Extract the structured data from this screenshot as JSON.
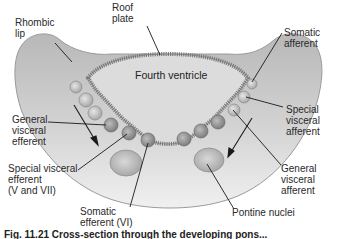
{
  "diagram": {
    "labels": {
      "roof_plate": "Roof\nplate",
      "rhombic_lip": "Rhombic\nlip",
      "fourth_ventricle": "Fourth ventricle",
      "somatic_afferent": "Somatic\nafferent",
      "special_visceral_afferent": "Special\nvisceral\nafferent",
      "general_visceral_efferent": "General\nvisceral\nefferent",
      "special_visceral_efferent": "Special visceral\nefferent\n(V and VII)",
      "general_visceral_afferent": "General\nvisceral\nafferent",
      "somatic_efferent": "Somatic\nefferent (VI)",
      "pontine_nuclei": "Pontine nuclei"
    },
    "caption": "Fig. 11.21  Cross-section through the developing pons...",
    "colors": {
      "tissue_light": "#e8e8e8",
      "tissue_dark": "#a9a9a9",
      "ventricle": "#d9d9d9",
      "roof_plate": "#8c8c8c",
      "nucleus_light": "#cfcfcf",
      "nucleus_dark": "#8f8f8f",
      "line": "#1a1a1a"
    }
  }
}
